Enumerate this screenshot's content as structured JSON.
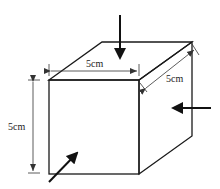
{
  "diagram": {
    "type": "cube-with-forces",
    "colors": {
      "edge": "#1a1a1a",
      "dimension": "#333333",
      "force": "#111111",
      "background": "#ffffff"
    },
    "dimensions": {
      "width": {
        "label": "5cm"
      },
      "depth": {
        "label": "5cm"
      },
      "height": {
        "label": "5cm"
      }
    },
    "forces": [
      {
        "name": "top-force",
        "direction": "downward onto top face"
      },
      {
        "name": "right-force",
        "direction": "leftward onto right face"
      },
      {
        "name": "front-force",
        "direction": "diagonal into front face"
      }
    ]
  }
}
